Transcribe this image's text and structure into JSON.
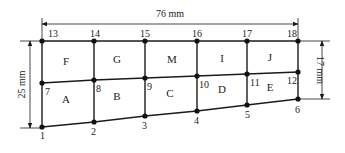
{
  "colors": {
    "line": "#1a1a1a",
    "node": "#111111",
    "text": "#222222",
    "background": "#ffffff"
  },
  "dimensions": {
    "top": {
      "label": "76 mm",
      "x1": 42,
      "x2": 298,
      "y": 24
    },
    "left": {
      "label": "25 mm",
      "x": 30,
      "y1": 41,
      "y2": 128
    },
    "right": {
      "label": "17 mm",
      "x": 322,
      "y1": 41,
      "y2": 98
    }
  },
  "nodes": [
    {
      "id": "1",
      "x": 42,
      "y": 127,
      "lx": 40,
      "ly": 139
    },
    {
      "id": "2",
      "x": 94,
      "y": 122,
      "lx": 91,
      "ly": 135
    },
    {
      "id": "3",
      "x": 145,
      "y": 116,
      "lx": 142,
      "ly": 129
    },
    {
      "id": "4",
      "x": 197,
      "y": 111,
      "lx": 194,
      "ly": 124
    },
    {
      "id": "5",
      "x": 247,
      "y": 105,
      "lx": 245,
      "ly": 118
    },
    {
      "id": "6",
      "x": 298,
      "y": 99,
      "lx": 295,
      "ly": 113
    },
    {
      "id": "7",
      "x": 42,
      "y": 83,
      "lx": 45,
      "ly": 95
    },
    {
      "id": "8",
      "x": 94,
      "y": 80,
      "lx": 96,
      "ly": 92
    },
    {
      "id": "9",
      "x": 145,
      "y": 78,
      "lx": 147,
      "ly": 90
    },
    {
      "id": "10",
      "x": 197,
      "y": 76,
      "lx": 199,
      "ly": 88
    },
    {
      "id": "11",
      "x": 247,
      "y": 74,
      "lx": 250,
      "ly": 86
    },
    {
      "id": "12",
      "x": 298,
      "y": 72,
      "lx": 287,
      "ly": 84
    },
    {
      "id": "13",
      "x": 42,
      "y": 41,
      "lx": 48,
      "ly": 37
    },
    {
      "id": "14",
      "x": 94,
      "y": 41,
      "lx": 90,
      "ly": 37
    },
    {
      "id": "15",
      "x": 145,
      "y": 41,
      "lx": 140,
      "ly": 37
    },
    {
      "id": "16",
      "x": 197,
      "y": 41,
      "lx": 192,
      "ly": 37
    },
    {
      "id": "17",
      "x": 247,
      "y": 41,
      "lx": 242,
      "ly": 37
    },
    {
      "id": "18",
      "x": 298,
      "y": 41,
      "lx": 287,
      "ly": 37
    }
  ],
  "elements": [
    {
      "id": "A",
      "x": 66,
      "y": 103
    },
    {
      "id": "B",
      "x": 117,
      "y": 100
    },
    {
      "id": "C",
      "x": 170,
      "y": 97
    },
    {
      "id": "D",
      "x": 222,
      "y": 93
    },
    {
      "id": "E",
      "x": 270,
      "y": 91
    },
    {
      "id": "F",
      "x": 66,
      "y": 65
    },
    {
      "id": "G",
      "x": 117,
      "y": 63
    },
    {
      "id": "M",
      "x": 172,
      "y": 63
    },
    {
      "id": "I",
      "x": 222,
      "y": 62
    },
    {
      "id": "J",
      "x": 270,
      "y": 61
    }
  ]
}
